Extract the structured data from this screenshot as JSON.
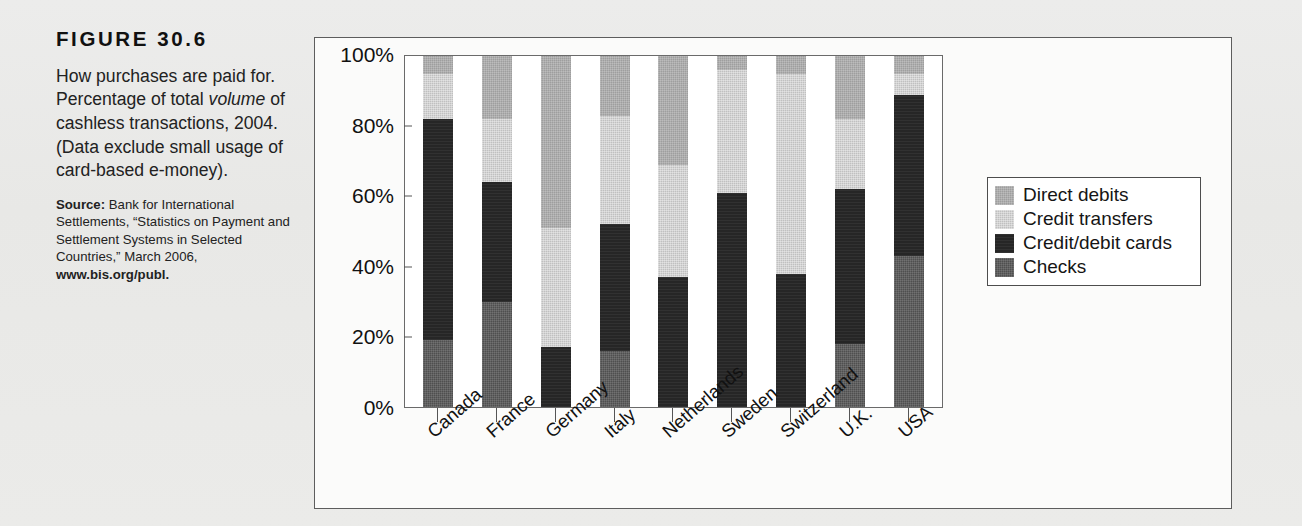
{
  "caption": {
    "figure_label": "FIGURE 30.6",
    "description_parts": [
      {
        "text": "How purchases are paid for. Percentage of total ",
        "style": "normal"
      },
      {
        "text": "volume",
        "style": "italic"
      },
      {
        "text": " of cashless transactions, 2004. (Data exclude small usage of card-based e-money).",
        "style": "normal"
      }
    ],
    "description_plain": "How purchases are paid for. Percentage of total volume of cashless transactions, 2004. (Data exclude small usage of card-based e-money).",
    "source_label": "Source:",
    "source_body": " Bank for International Settlements, “Statistics on Payment and Settlement Systems in Selected Countries,” March 2006, ",
    "source_url": "www.bis.org/publ."
  },
  "chart_data": {
    "type": "bar",
    "stacked": true,
    "title": "",
    "xlabel": "",
    "ylabel": "",
    "ylim": [
      0,
      100
    ],
    "yticks": [
      "0%",
      "20%",
      "40%",
      "60%",
      "80%",
      "100%"
    ],
    "ytick_values": [
      0,
      20,
      40,
      60,
      80,
      100
    ],
    "grid": false,
    "legend_position": "right",
    "categories": [
      "Canada",
      "France",
      "Germany",
      "Italy",
      "Netherlands",
      "Sweden",
      "Switzerland",
      "U.K.",
      "USA"
    ],
    "series": [
      {
        "name": "Checks",
        "color": "#4f4f4f",
        "values": [
          19,
          30,
          0,
          16,
          0,
          0,
          0,
          18,
          43
        ]
      },
      {
        "name": "Credit/debit cards",
        "color": "#262626",
        "values": [
          63,
          34,
          17,
          36,
          37,
          61,
          38,
          44,
          46
        ]
      },
      {
        "name": "Credit transfers",
        "color": "#c0c0c0",
        "values": [
          13,
          18,
          34,
          31,
          32,
          35,
          57,
          20,
          6
        ]
      },
      {
        "name": "Direct debits",
        "color": "#9e9e9e",
        "values": [
          5,
          18,
          49,
          17,
          31,
          4,
          5,
          18,
          5
        ]
      }
    ],
    "legend_order": [
      "Direct debits",
      "Credit transfers",
      "Credit/debit cards",
      "Checks"
    ]
  },
  "colors": {
    "direct_debits": "#9e9e9e",
    "credit_transfers": "#c0c0c0",
    "credit_debit_cards": "#262626",
    "checks": "#4f4f4f",
    "frame": "#5d5d5d",
    "page_bg": "#e9e9e7"
  }
}
